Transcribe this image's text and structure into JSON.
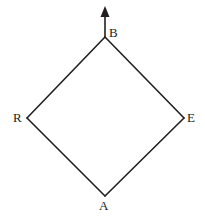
{
  "figure": {
    "type": "geometry-diagram",
    "background_color": "#ffffff",
    "stroke_color": "#231f20",
    "stroke_width": 1.6,
    "canvas": {
      "width": 205,
      "height": 219
    },
    "vertices": [
      {
        "id": "B",
        "label": "B",
        "x": 105,
        "y": 37,
        "label_x": 109,
        "label_y": 26,
        "position": "top"
      },
      {
        "id": "R",
        "label": "R",
        "x": 27,
        "y": 118,
        "label_x": 13,
        "label_y": 111,
        "position": "left"
      },
      {
        "id": "E",
        "label": "E",
        "x": 184,
        "y": 118,
        "label_x": 187,
        "label_y": 111,
        "position": "right"
      },
      {
        "id": "A",
        "label": "A",
        "x": 105,
        "y": 196,
        "label_x": 99,
        "label_y": 199,
        "position": "bottom"
      }
    ],
    "edges": [
      {
        "id": "edge-B-R",
        "from": "B",
        "to": "R"
      },
      {
        "id": "edge-B-E",
        "from": "B",
        "to": "E"
      },
      {
        "id": "edge-R-A",
        "from": "R",
        "to": "A"
      },
      {
        "id": "edge-E-A",
        "from": "E",
        "to": "A"
      }
    ],
    "arrow": {
      "id": "arrow-up-from-B",
      "from_x": 105,
      "from_y": 37,
      "to_x": 105,
      "to_y": 6,
      "direction": "up",
      "head_width": 9,
      "head_length": 11
    }
  }
}
